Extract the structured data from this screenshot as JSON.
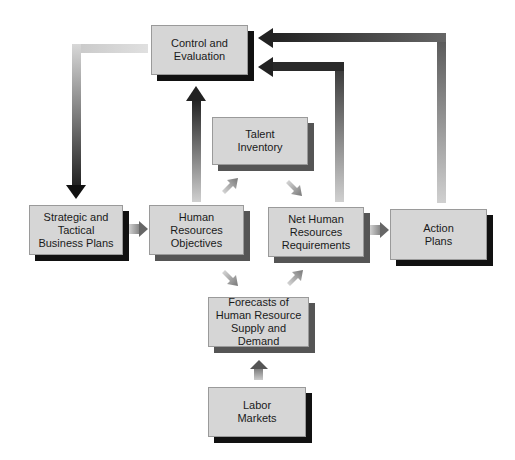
{
  "diagram": {
    "nodes": [
      {
        "id": "control",
        "label": "Control and\nEvaluation"
      },
      {
        "id": "strategic",
        "label": "Strategic and\nTactical\nBusiness Plans"
      },
      {
        "id": "hr_objectives",
        "label": "Human\nResources\nObjectives"
      },
      {
        "id": "talent",
        "label": "Talent\nInventory"
      },
      {
        "id": "net_hr",
        "label": "Net Human\nResources\nRequirements"
      },
      {
        "id": "action",
        "label": "Action\nPlans"
      },
      {
        "id": "forecasts",
        "label": "Forecasts of\nHuman Resource\nSupply and Demand"
      },
      {
        "id": "labor",
        "label": "Labor\nMarkets"
      }
    ],
    "edges": [
      {
        "from": "control",
        "to": "strategic"
      },
      {
        "from": "strategic",
        "to": "hr_objectives"
      },
      {
        "from": "hr_objectives",
        "to": "control"
      },
      {
        "from": "hr_objectives",
        "to": "talent"
      },
      {
        "from": "hr_objectives",
        "to": "forecasts"
      },
      {
        "from": "talent",
        "to": "net_hr"
      },
      {
        "from": "forecasts",
        "to": "net_hr"
      },
      {
        "from": "net_hr",
        "to": "action"
      },
      {
        "from": "net_hr",
        "to": "control"
      },
      {
        "from": "action",
        "to": "control"
      },
      {
        "from": "labor",
        "to": "forecasts"
      }
    ],
    "colors": {
      "box": "#d6d6d6",
      "shadow_dark": "#111111",
      "shadow_gray": "#555555",
      "arrow_dark": "#222222",
      "arrow_light": "#d8d8d8"
    }
  }
}
